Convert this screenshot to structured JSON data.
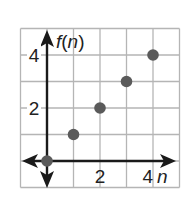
{
  "chart_data": {
    "type": "scatter",
    "title": "",
    "xlabel": "n",
    "ylabel": "f(n)",
    "x": [
      0,
      1,
      2,
      3,
      4
    ],
    "series": [
      {
        "name": "f(n)",
        "values": [
          0,
          1,
          2,
          3,
          4
        ],
        "color": "#5a5a5a"
      }
    ],
    "xlim": [
      -1,
      5
    ],
    "ylim": [
      -1,
      5
    ],
    "x_tick_labels": [
      "2",
      "4"
    ],
    "x_tick_values": [
      2,
      4
    ],
    "y_tick_labels": [
      "2",
      "4"
    ],
    "y_tick_values": [
      2,
      4
    ],
    "grid": true,
    "legend": "none"
  },
  "axis": {
    "x_label": "n",
    "y_label_f": "f",
    "y_label_open": "(",
    "y_label_n": "n",
    "y_label_close": ")"
  },
  "ticks": {
    "x2": "2",
    "x4": "4",
    "y2": "2",
    "y4": "4"
  },
  "colors": {
    "grid": "#b5b5b5",
    "axis": "#1a1a1a",
    "point": "#5a5a5a"
  }
}
